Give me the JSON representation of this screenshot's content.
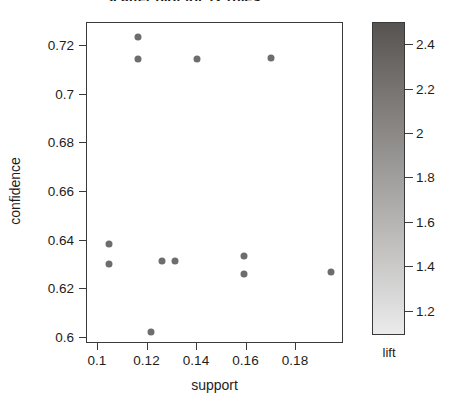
{
  "chart_data": {
    "type": "scatter",
    "title": "Scatter plot for 12 rules",
    "xlabel": "support",
    "ylabel": "confidence",
    "xlim": [
      0.0931,
      0.2,
      0.1
    ],
    "ylim": [
      0.5965,
      0.7285
    ],
    "xticks": [
      "0.1",
      "0.12",
      "0.14",
      "0.16",
      "0.18"
    ],
    "xtick_values": [
      0.1,
      0.12,
      0.14,
      0.16,
      0.18
    ],
    "yticks": [
      "0.72",
      "0.7",
      "0.68",
      "0.66",
      "0.64",
      "0.62",
      "0.6"
    ],
    "ytick_values": [
      0.72,
      0.7,
      0.68,
      0.66,
      0.64,
      0.62,
      0.6
    ],
    "grid": false,
    "point_color": "#6d6d6d",
    "x": [
      0.116,
      0.116,
      0.14,
      0.17,
      0.1045,
      0.1045,
      0.126,
      0.131,
      0.159,
      0.159,
      0.194,
      0.1215
    ],
    "y": [
      0.7235,
      0.7145,
      0.7145,
      0.715,
      0.6385,
      0.6305,
      0.6315,
      0.6315,
      0.6335,
      0.6262,
      0.627,
      0.6025
    ],
    "colorbar": {
      "label": "lift",
      "ticks": [
        "2.4",
        "2.2",
        "2",
        "1.8",
        "1.6",
        "1.4",
        "1.2"
      ],
      "tick_values": [
        2.4,
        2.2,
        2.0,
        1.8,
        1.6,
        1.4,
        1.2
      ],
      "range": [
        1.09,
        2.5
      ],
      "color_high": "#575350",
      "color_low": "#ebebeb"
    }
  }
}
